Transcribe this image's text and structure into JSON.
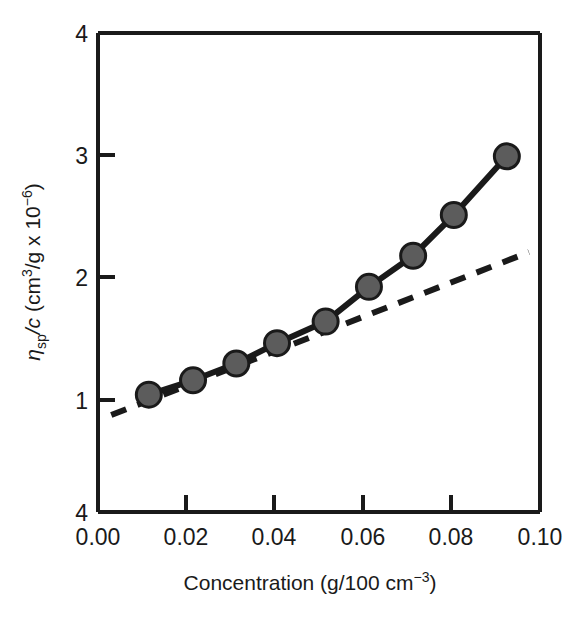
{
  "chart_data": {
    "type": "line",
    "title": "",
    "subtitle": "",
    "xlabel": "Concentration (g/100 cm−3)",
    "ylabel": "ηsp/c (cm3/g x 10−6)",
    "ylabel_parts": {
      "eta": "η",
      "eta_sub": "sp",
      "slash_c": "/c",
      "unit_open": " (cm",
      "unit_sup1": "3",
      "unit_mid": "/g x 10",
      "unit_sup2": "−6",
      "unit_close": ")"
    },
    "xlabel_parts": {
      "main": "Concentration (g/100 cm",
      "sup": "−3",
      "close": ")"
    },
    "xlim": [
      0.0,
      0.1
    ],
    "ylim": [
      0.0,
      4.0
    ],
    "xticks": [
      0.0,
      0.02,
      0.04,
      0.06,
      0.08,
      0.1
    ],
    "xtick_labels": [
      "0.00",
      "0.02",
      "0.04",
      "0.06",
      "0.08",
      "0.10"
    ],
    "yticks": [
      1,
      2,
      3
    ],
    "ytick_labels": [
      "1",
      "2",
      "3"
    ],
    "ytop_label": "4",
    "ybottom_label": "4",
    "grid": false,
    "legend": false,
    "legend_position": "none",
    "series": [
      {
        "name": "measured",
        "style": "solid-with-markers",
        "marker": "filled-circle",
        "marker_fill": "#5c5c5c",
        "marker_edge": "#1a1a1a",
        "line_color": "#1a1a1a",
        "x": [
          0.0115,
          0.0215,
          0.0313,
          0.0405,
          0.0515,
          0.0613,
          0.0713,
          0.0805,
          0.0925
        ],
        "y": [
          0.98,
          1.1,
          1.24,
          1.41,
          1.59,
          1.88,
          2.14,
          2.48,
          2.97
        ]
      },
      {
        "name": "extrapolated-linear-fit",
        "style": "dashed",
        "marker": "none",
        "line_color": "#1a1a1a",
        "x": [
          0.003,
          0.0975
        ],
        "y": [
          0.81,
          2.17
        ]
      }
    ]
  },
  "colors": {
    "axis": "#1a1a1a",
    "marker_fill": "#5c5c5c",
    "marker_edge": "#1a1a1a",
    "background": "#ffffff"
  }
}
